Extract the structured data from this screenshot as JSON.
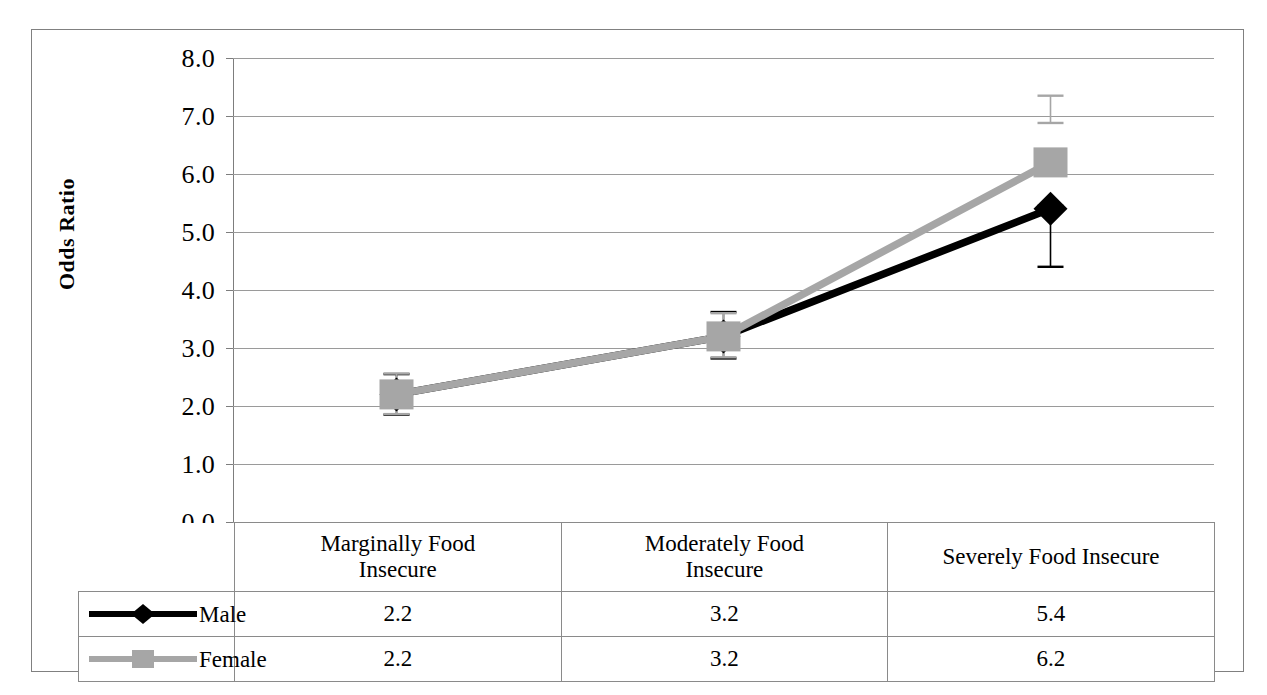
{
  "chart_data": {
    "type": "line",
    "title": "",
    "xlabel": "",
    "ylabel": "Odds Ratio",
    "ylim": [
      0.0,
      8.0
    ],
    "ytick_labels": [
      "8.0",
      "7.0",
      "6.0",
      "5.0",
      "4.0",
      "3.0",
      "2.0",
      "1.0",
      "0.0"
    ],
    "ytick_values": [
      8.0,
      7.0,
      6.0,
      5.0,
      4.0,
      3.0,
      2.0,
      1.0,
      0.0
    ],
    "grid": true,
    "legend_position": "table-row-headers",
    "categories": [
      "Marginally Food Insecure",
      "Moderately Food Insecure",
      "Severely Food Insecure"
    ],
    "series": [
      {
        "name": "Male",
        "color": "#000000",
        "marker": "diamond",
        "values": [
          2.2,
          3.2,
          5.4
        ],
        "error_low": [
          1.85,
          2.82,
          4.4
        ],
        "error_high": [
          2.55,
          3.62,
          5.45
        ]
      },
      {
        "name": "Female",
        "color": "#a6a6a6",
        "marker": "square",
        "values": [
          2.2,
          3.2,
          6.2
        ],
        "error_low": [
          1.86,
          2.84,
          6.88
        ],
        "error_high": [
          2.56,
          3.6,
          7.35
        ]
      }
    ],
    "table": {
      "row_labels": [
        "Male",
        "Female"
      ],
      "column_headers": [
        "Marginally Food Insecure",
        "Moderately Food Insecure",
        "Severely Food Insecure"
      ],
      "rows": [
        {
          "label": "Male",
          "cells": [
            "2.2",
            "3.2",
            "5.4"
          ]
        },
        {
          "label": "Female",
          "cells": [
            "2.2",
            "3.2",
            "6.2"
          ]
        }
      ]
    }
  },
  "axis": {
    "y_title": "Odds Ratio",
    "ticks": [
      "8.0",
      "7.0",
      "6.0",
      "5.0",
      "4.0",
      "3.0",
      "2.0",
      "1.0",
      "0.0"
    ]
  },
  "table": {
    "headers": [
      "Marginally Food\nInsecure",
      "Moderately Food\nInsecure",
      "Severely Food Insecure"
    ],
    "header_0_line1": "Marginally Food",
    "header_0_line2": "Insecure",
    "header_1_line1": "Moderately Food",
    "header_1_line2": "Insecure",
    "header_2_line1": "Severely Food Insecure",
    "rows": [
      {
        "label": "Male",
        "c0": "2.2",
        "c1": "3.2",
        "c2": "5.4"
      },
      {
        "label": "Female",
        "c0": "2.2",
        "c1": "3.2",
        "c2": "6.2"
      }
    ]
  },
  "colors": {
    "male": "#000000",
    "female": "#a6a6a6",
    "gridline": "#9a9a9a",
    "border": "#808080"
  }
}
